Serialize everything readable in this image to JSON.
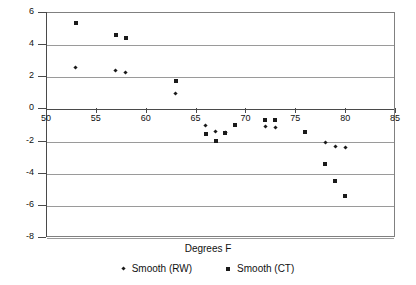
{
  "chart_data": {
    "type": "scatter",
    "title": "",
    "xlabel": "Degrees F",
    "ylabel": "",
    "xlim": [
      50,
      85
    ],
    "ylim": [
      -8,
      6
    ],
    "xticks": [
      50,
      55,
      60,
      65,
      70,
      75,
      80,
      85
    ],
    "yticks": [
      6,
      4,
      2,
      0,
      -2,
      -4,
      -6,
      -8
    ],
    "grid": "horizontal",
    "legend_position": "bottom",
    "series": [
      {
        "name": "Smooth (RW)",
        "marker": "diamond",
        "color": "#1a1a1a",
        "points": [
          [
            53,
            2.55
          ],
          [
            57,
            2.35
          ],
          [
            58,
            2.25
          ],
          [
            63,
            0.95
          ],
          [
            66,
            -1.05
          ],
          [
            67,
            -1.45
          ],
          [
            68,
            -1.5
          ],
          [
            72,
            -1.15
          ],
          [
            73,
            -1.2
          ],
          [
            78,
            -2.1
          ],
          [
            79,
            -2.35
          ],
          [
            80,
            -2.45
          ]
        ]
      },
      {
        "name": "Smooth (CT)",
        "marker": "square",
        "color": "#1a1a1a",
        "points": [
          [
            53,
            5.3
          ],
          [
            57,
            4.6
          ],
          [
            58,
            4.4
          ],
          [
            63,
            1.7
          ],
          [
            66,
            -1.6
          ],
          [
            67,
            -2.0
          ],
          [
            68,
            -1.5
          ],
          [
            69,
            -1.0
          ],
          [
            72,
            -0.7
          ],
          [
            73,
            -0.75
          ],
          [
            76,
            -1.45
          ],
          [
            78,
            -3.45
          ],
          [
            79,
            -4.5
          ],
          [
            80,
            -5.45
          ]
        ]
      }
    ]
  },
  "legend": {
    "items": [
      {
        "label": "Smooth (RW)",
        "marker": "diamond-marker-icon"
      },
      {
        "label": "Smooth (CT)",
        "marker": "square-marker-icon"
      }
    ]
  },
  "axis": {
    "x_title": "Degrees F"
  },
  "colors": {
    "gridline": "#9a9a9a",
    "axis": "#4a4a4a",
    "marker": "#1a1a1a",
    "background": "#ffffff"
  }
}
